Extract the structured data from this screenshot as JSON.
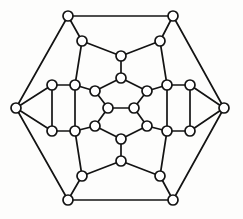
{
  "figure": {
    "background_color": "#fdfdfc",
    "node_fill_color": "#ffffff",
    "node_stroke_color": "#131313",
    "edge_color": "#131313",
    "node_radius": 5.0,
    "edge_width": 1.7,
    "node_count": 26,
    "edge_count": 39,
    "degree": 3
  },
  "chart_data": {
    "type": "diagram",
    "xlabel": "",
    "ylabel": "",
    "grid": false,
    "legend": false,
    "xlim": [
      0,
      243
    ],
    "ylim": [
      0,
      219
    ],
    "nodes": [
      {
        "id": "h1",
        "label": "",
        "ring": "outer",
        "x": 68,
        "y": 16
      },
      {
        "id": "h2",
        "label": "",
        "ring": "outer",
        "x": 173,
        "y": 16
      },
      {
        "id": "h3",
        "label": "",
        "ring": "outer",
        "x": 224,
        "y": 108
      },
      {
        "id": "h4",
        "label": "",
        "ring": "outer",
        "x": 173,
        "y": 200
      },
      {
        "id": "h5",
        "label": "",
        "ring": "outer",
        "x": 68,
        "y": 200
      },
      {
        "id": "h6",
        "label": "",
        "ring": "outer",
        "x": 16,
        "y": 108
      },
      {
        "id": "m1",
        "label": "",
        "ring": "middle",
        "x": 82,
        "y": 41
      },
      {
        "id": "m2",
        "label": "",
        "ring": "middle",
        "x": 160,
        "y": 41
      },
      {
        "id": "m3",
        "label": "",
        "ring": "middle",
        "x": 190,
        "y": 85
      },
      {
        "id": "m4",
        "label": "",
        "ring": "middle",
        "x": 190,
        "y": 131
      },
      {
        "id": "m5",
        "label": "",
        "ring": "middle",
        "x": 160,
        "y": 176
      },
      {
        "id": "m6",
        "label": "",
        "ring": "middle",
        "x": 82,
        "y": 176
      },
      {
        "id": "m7",
        "label": "",
        "ring": "middle",
        "x": 52,
        "y": 131
      },
      {
        "id": "m8",
        "label": "",
        "ring": "middle",
        "x": 52,
        "y": 85
      },
      {
        "id": "m9",
        "label": "",
        "ring": "middle",
        "x": 75,
        "y": 85
      },
      {
        "id": "m10",
        "label": "",
        "ring": "middle",
        "x": 167,
        "y": 85
      },
      {
        "id": "m11",
        "label": "",
        "ring": "middle",
        "x": 167,
        "y": 131
      },
      {
        "id": "m12",
        "label": "",
        "ring": "middle",
        "x": 75,
        "y": 131
      },
      {
        "id": "i1",
        "label": "",
        "ring": "inner",
        "x": 121,
        "y": 56
      },
      {
        "id": "i2",
        "label": "",
        "ring": "inner",
        "x": 121,
        "y": 78
      },
      {
        "id": "i3",
        "label": "",
        "ring": "inner",
        "x": 95,
        "y": 91
      },
      {
        "id": "i4",
        "label": "",
        "ring": "inner",
        "x": 147,
        "y": 91
      },
      {
        "id": "i5",
        "label": "",
        "ring": "inner",
        "x": 95,
        "y": 126
      },
      {
        "id": "i6",
        "label": "",
        "ring": "inner",
        "x": 147,
        "y": 126
      },
      {
        "id": "i7",
        "label": "",
        "ring": "inner",
        "x": 121,
        "y": 139
      },
      {
        "id": "i8",
        "label": "",
        "ring": "inner",
        "x": 121,
        "y": 161
      },
      {
        "id": "c1",
        "label": "",
        "ring": "center",
        "x": 108,
        "y": 108
      },
      {
        "id": "c2",
        "label": "",
        "ring": "center",
        "x": 134,
        "y": 108
      }
    ],
    "edges": [
      {
        "from": "h1",
        "to": "h2"
      },
      {
        "from": "h2",
        "to": "h3"
      },
      {
        "from": "h3",
        "to": "h4"
      },
      {
        "from": "h4",
        "to": "h5"
      },
      {
        "from": "h5",
        "to": "h6"
      },
      {
        "from": "h6",
        "to": "h1"
      },
      {
        "from": "h1",
        "to": "m1"
      },
      {
        "from": "h2",
        "to": "m2"
      },
      {
        "from": "h3",
        "to": "m3"
      },
      {
        "from": "h3",
        "to": "m4"
      },
      {
        "from": "h4",
        "to": "m5"
      },
      {
        "from": "h5",
        "to": "m6"
      },
      {
        "from": "h6",
        "to": "m7"
      },
      {
        "from": "h6",
        "to": "m8"
      },
      {
        "from": "m1",
        "to": "i1"
      },
      {
        "from": "m2",
        "to": "i1"
      },
      {
        "from": "m1",
        "to": "m9"
      },
      {
        "from": "m2",
        "to": "m10"
      },
      {
        "from": "m3",
        "to": "m10"
      },
      {
        "from": "m4",
        "to": "m11"
      },
      {
        "from": "m5",
        "to": "m11"
      },
      {
        "from": "m6",
        "to": "m12"
      },
      {
        "from": "m7",
        "to": "m12"
      },
      {
        "from": "m8",
        "to": "m9"
      },
      {
        "from": "m8",
        "to": "m7"
      },
      {
        "from": "m3",
        "to": "m4"
      },
      {
        "from": "m9",
        "to": "i3"
      },
      {
        "from": "m10",
        "to": "i4"
      },
      {
        "from": "m11",
        "to": "i6"
      },
      {
        "from": "m12",
        "to": "i5"
      },
      {
        "from": "m9",
        "to": "m12"
      },
      {
        "from": "m10",
        "to": "m11"
      },
      {
        "from": "i1",
        "to": "i2"
      },
      {
        "from": "i2",
        "to": "i3"
      },
      {
        "from": "i2",
        "to": "i4"
      },
      {
        "from": "i3",
        "to": "c1"
      },
      {
        "from": "i4",
        "to": "c2"
      },
      {
        "from": "c1",
        "to": "c2"
      },
      {
        "from": "c1",
        "to": "i5"
      },
      {
        "from": "c2",
        "to": "i6"
      },
      {
        "from": "i5",
        "to": "i7"
      },
      {
        "from": "i6",
        "to": "i7"
      },
      {
        "from": "i7",
        "to": "i8"
      },
      {
        "from": "i8",
        "to": "m6"
      },
      {
        "from": "i8",
        "to": "m5"
      }
    ]
  }
}
